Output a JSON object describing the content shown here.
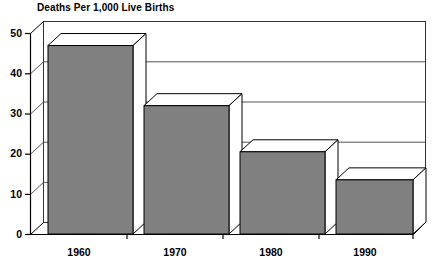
{
  "chart_data": {
    "type": "bar",
    "title": "Deaths Per 1,000 Live Births",
    "xlabel": "",
    "ylabel": "",
    "categories": [
      "1960",
      "1970",
      "1980",
      "1990"
    ],
    "values": [
      47,
      32,
      20.5,
      13.5
    ],
    "series": [
      {
        "name": "Deaths Per 1,000 Live Births",
        "values": [
          47,
          32,
          20.5,
          13.5
        ]
      }
    ],
    "ylim": [
      0,
      50
    ],
    "yticks": [
      0,
      10,
      20,
      30,
      40,
      50
    ],
    "ytick_labels": [
      "0",
      "10",
      "20",
      "30",
      "40",
      "50"
    ],
    "grid": true,
    "grid_axis": "y",
    "legend": false,
    "legend_position": "none",
    "style": "3d-bar",
    "colors": {
      "bar_fill": "#808080",
      "bar_top": "#ffffff",
      "bar_side": "#ffffff",
      "outline": "#000000",
      "grid": "#555555",
      "background": "#ffffff",
      "text": "#000000"
    }
  },
  "axes": {
    "y": {
      "ticks": [
        {
          "label": "50",
          "value": 50
        },
        {
          "label": "40",
          "value": 40
        },
        {
          "label": "30",
          "value": 30
        },
        {
          "label": "20",
          "value": 20
        },
        {
          "label": "10",
          "value": 10
        },
        {
          "label": "0",
          "value": 0
        }
      ]
    },
    "x": {
      "ticks": [
        {
          "label": "1960"
        },
        {
          "label": "1970"
        },
        {
          "label": "1980"
        },
        {
          "label": "1990"
        }
      ]
    }
  }
}
